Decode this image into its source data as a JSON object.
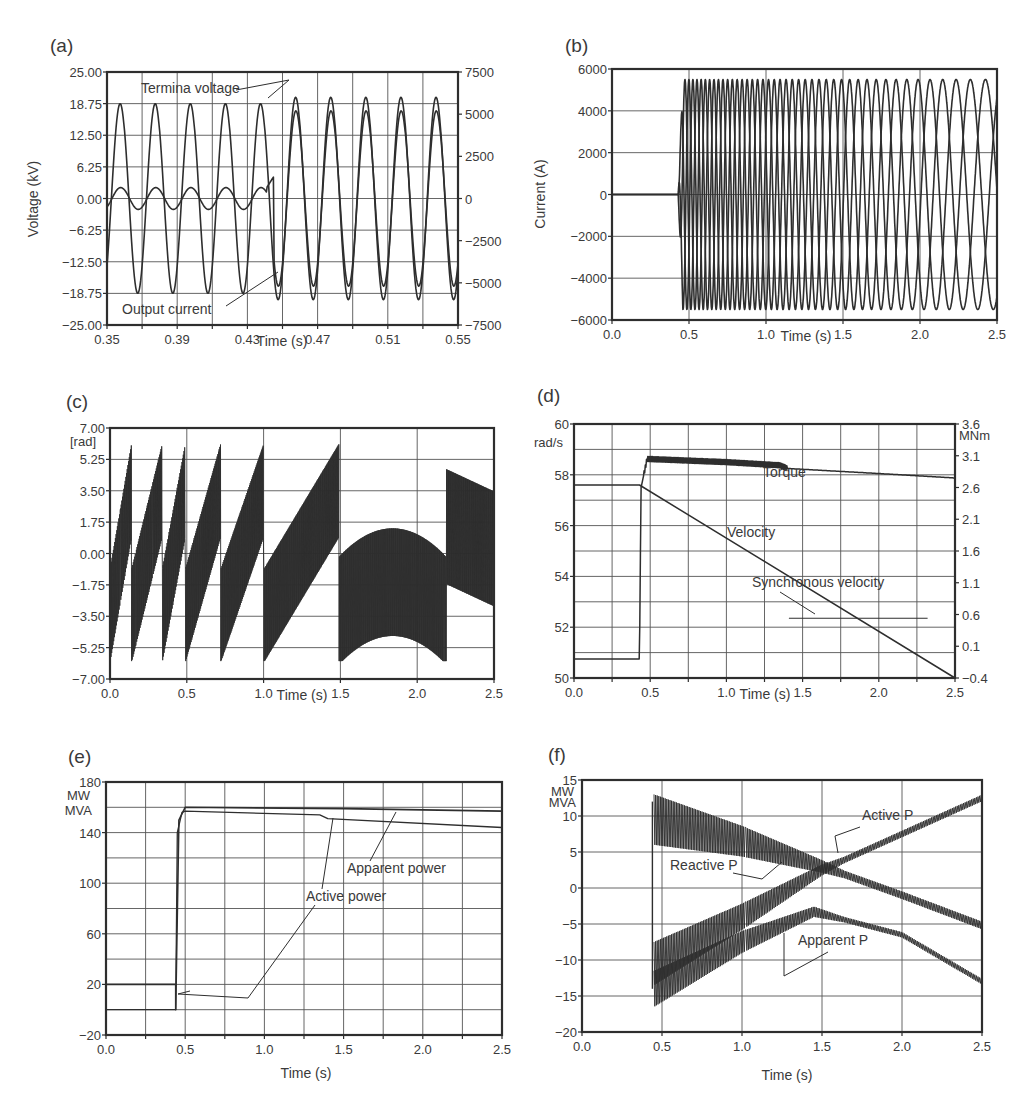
{
  "figure": {
    "panels": [
      "a",
      "b",
      "c",
      "d",
      "e",
      "f"
    ]
  },
  "chart_data": [
    {
      "id": "a",
      "panel_label": "(a)",
      "type": "line",
      "title": "",
      "xlabel": "Time (s)",
      "ylabel": "Voltage (kV)",
      "y2label": "",
      "xlim": [
        0.35,
        0.55
      ],
      "ylim": [
        -25.0,
        25.0
      ],
      "y2lim": [
        -7500,
        7500
      ],
      "xticks": [
        "0.35",
        "0.39",
        "0.43",
        "0.47",
        "0.51",
        "0.55"
      ],
      "yticks": [
        "25.00",
        "18.75",
        "12.50",
        "6.25",
        "0.00",
        "-6.25",
        "-12.50",
        "-18.75",
        "-25.00"
      ],
      "y2ticks": [
        "7500",
        "5000",
        "2500",
        "0",
        "-2500",
        "-5000",
        "-7500"
      ],
      "grid": true,
      "series": [
        {
          "name": "Terminal voltage",
          "axis": "left",
          "description": "50 Hz sinusoid, amplitude ~18.75 kV before 0.44 s, ~20 kV after"
        },
        {
          "name": "Output current",
          "axis": "right",
          "description": "~600 A amplitude before 0.44 s, rising to ~5200 A after, in phase with voltage"
        }
      ],
      "annotations": [
        "Termina  voltage",
        "Output current"
      ]
    },
    {
      "id": "b",
      "panel_label": "(b)",
      "type": "line",
      "xlabel": "Time (s)",
      "ylabel": "Current (A)",
      "xlim": [
        0.0,
        2.5
      ],
      "ylim": [
        -6000,
        6000
      ],
      "xticks": [
        "0.0",
        "0.5",
        "1.0",
        "1.5",
        "2.0",
        "2.5"
      ],
      "yticks": [
        "6000",
        "4000",
        "2000",
        "0",
        "-2000",
        "-4000",
        "-6000"
      ],
      "grid": true,
      "series": [
        {
          "name": "Phase currents (3-phase)",
          "description": "0 A until 0.43 s, then ~5500 A amplitude with decreasing frequency (period grows from ~0.07 s to ~0.5 s)"
        }
      ]
    },
    {
      "id": "c",
      "panel_label": "(c)",
      "type": "line",
      "xlabel": "Time (s)",
      "ylabel": "[rad]",
      "xlim": [
        0.0,
        2.5
      ],
      "ylim": [
        -7.0,
        7.0
      ],
      "xticks": [
        "0.0",
        "0.5",
        "1.0",
        "1.5",
        "2.0",
        "2.5"
      ],
      "yticks": [
        "7.00",
        "5.25",
        "3.50",
        "1.75",
        "0.00",
        "-1.75",
        "-3.50",
        "-5.25",
        "-7.00"
      ],
      "grid": true,
      "series": [
        {
          "name": "Rotor angle",
          "description": "Sawtooth-like oscillating envelope with wraps near 0.14, 0.34, 0.49, 0.72, 1.0, 1.49, 2.19 s; range about -6 to 6.3 rad"
        }
      ]
    },
    {
      "id": "d",
      "panel_label": "(d)",
      "type": "line",
      "xlabel": "Time (s)",
      "ylabel": "rad/s",
      "y2label": "MNm",
      "xlim": [
        0.0,
        2.5
      ],
      "ylim": [
        50,
        60
      ],
      "y2lim": [
        -0.4,
        3.6
      ],
      "xticks": [
        "0.0",
        "0.5",
        "1.0",
        "1.5",
        "2.0",
        "2.5"
      ],
      "yticks": [
        "60",
        "58",
        "56",
        "54",
        "52",
        "50"
      ],
      "y2ticks": [
        "3.6",
        "3.1",
        "2.6",
        "2.1",
        "1.6",
        "1.1",
        "0.6",
        "0.1",
        "-0.4"
      ],
      "grid": true,
      "series": [
        {
          "name": "Torque",
          "axis": "right",
          "x": [
            0.0,
            0.43,
            0.44,
            0.48,
            1.0,
            1.35,
            1.4,
            2.0,
            2.5
          ],
          "y": [
            -0.1,
            -0.1,
            2.6,
            3.05,
            3.0,
            2.95,
            2.9,
            2.82,
            2.75
          ]
        },
        {
          "name": "Velocity",
          "axis": "left",
          "x": [
            0.0,
            0.43,
            2.5
          ],
          "y": [
            57.6,
            57.6,
            50.0
          ]
        },
        {
          "name": "Synchronous velocity",
          "axis": "left",
          "x": [
            1.41,
            2.32
          ],
          "y": [
            52.35,
            52.35
          ]
        }
      ],
      "annotations": [
        "Torque",
        "Velocity",
        "Synchronous velocity"
      ]
    },
    {
      "id": "e",
      "panel_label": "(e)",
      "type": "line",
      "xlabel": "Time (s)",
      "ylabel": "MW\nMVA",
      "xlim": [
        0.0,
        2.5
      ],
      "ylim": [
        -20,
        180
      ],
      "xticks": [
        "0.0",
        "0.5",
        "1.0",
        "1.5",
        "2.0",
        "2.5"
      ],
      "yticks": [
        "180",
        "140",
        "100",
        "60",
        "20",
        "-20"
      ],
      "grid": true,
      "series": [
        {
          "name": "Apparent power",
          "x": [
            0.0,
            0.44,
            0.44,
            0.46,
            0.5,
            1.5,
            2.5
          ],
          "y": [
            20,
            20,
            0,
            150,
            160,
            159,
            157
          ]
        },
        {
          "name": "Active power",
          "x": [
            0.0,
            0.44,
            0.45,
            0.48,
            0.5,
            1.35,
            1.4,
            2.5
          ],
          "y": [
            0,
            0,
            140,
            156,
            157,
            154,
            151,
            144
          ]
        }
      ],
      "annotations": [
        "Apparent power",
        "Active power"
      ]
    },
    {
      "id": "f",
      "panel_label": "(f)",
      "type": "line",
      "xlabel": "Time (s)",
      "ylabel": "MW\nMVA",
      "xlim": [
        0.0,
        2.5
      ],
      "ylim": [
        -20,
        15
      ],
      "xticks": [
        "0.0",
        "0.5",
        "1.0",
        "1.5",
        "2.0",
        "2.5"
      ],
      "yticks": [
        "15",
        "10",
        "5",
        "0",
        "-5",
        "-10",
        "-15",
        "-20"
      ],
      "grid": true,
      "series": [
        {
          "name": "Reactive P",
          "x": [
            0.45,
            1.0,
            1.5,
            2.0,
            2.5
          ],
          "y": [
            9.5,
            6.5,
            3.0,
            -1.0,
            -5.2
          ]
        },
        {
          "name": "Active P",
          "x": [
            0.45,
            1.0,
            1.5,
            2.0,
            2.5
          ],
          "y": [
            -10.5,
            -4.0,
            2.5,
            7.5,
            12.5
          ]
        },
        {
          "name": "Apparent P",
          "x": [
            0.45,
            1.0,
            1.45,
            2.0,
            2.5
          ],
          "y": [
            -14.0,
            -7.5,
            -3.3,
            -6.5,
            -13.0
          ]
        }
      ],
      "annotations": [
        "Active P",
        "Reactive P",
        "Apparent P"
      ]
    }
  ]
}
